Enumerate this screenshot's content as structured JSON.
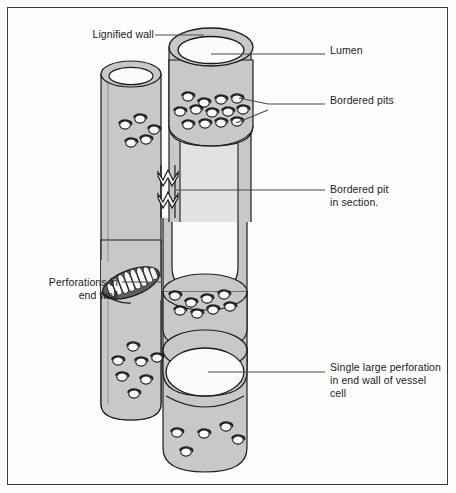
{
  "figure": {
    "background_color": "#fdfdfd",
    "frame_border_color": "#3a3a3a",
    "wall_fill_color": "#c8c8c8",
    "wall_fill_shaded_color": "#bdbdbd",
    "lumen_fill_color": "#fbfbfb",
    "outline_color": "#1b1b1b",
    "leader_line_color": "#4a4a4a"
  },
  "labels": [
    {
      "id": "lignified-wall",
      "text": "Lignified wall",
      "align": "right",
      "x": 70,
      "y": 28,
      "width": 84
    },
    {
      "id": "lumen",
      "text": "Lumen",
      "align": "left",
      "x": 330,
      "y": 44,
      "width": 110
    },
    {
      "id": "bordered-pits",
      "text": "Bordered pits",
      "align": "left",
      "x": 330,
      "y": 94,
      "width": 110
    },
    {
      "id": "bordered-pit-in-section",
      "text": "Bordered pit\nin section.",
      "align": "left",
      "x": 330,
      "y": 183,
      "width": 115
    },
    {
      "id": "perforations-in-end-wall",
      "text": "Perforations in\nend wall",
      "align": "right",
      "x": 14,
      "y": 276,
      "width": 104
    },
    {
      "id": "single-large-perforation",
      "text": "Single large perforation\nin end wall of vessel\ncell",
      "align": "left",
      "x": 330,
      "y": 361,
      "width": 122
    }
  ],
  "leader_lines": [
    {
      "id": "leader-lignified-wall",
      "points": "155,35 204,35"
    },
    {
      "id": "leader-lumen",
      "points": "211,54 325,54"
    },
    {
      "id": "leader-bordered-pits-upper",
      "points": "239,98 268,104 325,104"
    },
    {
      "id": "leader-bordered-pits-lower",
      "points": "236,123 268,110"
    },
    {
      "id": "leader-bordered-pit-section",
      "points": "176,190 325,190"
    },
    {
      "id": "leader-perforations",
      "points": "122,282 162,282"
    },
    {
      "id": "leader-single-perforation",
      "points": "208,372 325,372"
    }
  ],
  "structures": {
    "left_tube": {
      "name": "tracheid-left",
      "top_ellipse_cx": 131,
      "top_ellipse_cy": 74,
      "pit_count": 11
    },
    "right_tube": {
      "name": "vessel-right",
      "top_ellipse_cx": 211,
      "top_ellipse_cy": 47,
      "pit_count": 19
    },
    "scalariform_plate": {
      "name": "scalariform-perforation-plate",
      "bar_count": 8
    },
    "simple_perforation": {
      "name": "simple-perforation-plate",
      "cx": 205,
      "cy": 372,
      "rx": 39,
      "ry": 24
    }
  },
  "pits": {
    "left_upper": [
      [
        125,
        125
      ],
      [
        140,
        119
      ],
      [
        154,
        130
      ],
      [
        131,
        143
      ],
      [
        146,
        140
      ]
    ],
    "right_upper": [
      [
        188,
        97
      ],
      [
        204,
        103
      ],
      [
        221,
        100
      ],
      [
        237,
        99
      ],
      [
        180,
        112
      ],
      [
        196,
        110
      ],
      [
        212,
        113
      ],
      [
        228,
        112
      ],
      [
        243,
        110
      ],
      [
        188,
        125
      ],
      [
        205,
        124
      ],
      [
        221,
        123
      ],
      [
        237,
        122
      ]
    ],
    "right_middle": [
      [
        175,
        296
      ],
      [
        191,
        303
      ],
      [
        207,
        299
      ],
      [
        224,
        295
      ],
      [
        180,
        311
      ],
      [
        197,
        314
      ],
      [
        213,
        310
      ],
      [
        230,
        307
      ]
    ],
    "left_lower": [
      [
        133,
        347
      ],
      [
        118,
        361
      ],
      [
        141,
        362
      ],
      [
        157,
        358
      ],
      [
        122,
        377
      ],
      [
        146,
        380
      ],
      [
        134,
        394
      ]
    ],
    "right_bottom": [
      [
        177,
        433
      ],
      [
        204,
        434
      ],
      [
        226,
        427
      ],
      [
        238,
        440
      ],
      [
        186,
        452
      ]
    ]
  }
}
